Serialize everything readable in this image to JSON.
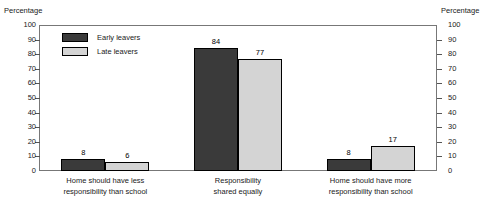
{
  "chart_data": {
    "type": "bar",
    "title": "",
    "subtitle": "",
    "xlabel": "",
    "ylabel": "Percentage",
    "ylabel_right": "Percentage",
    "ylim": [
      0,
      100
    ],
    "ytick_step": 10,
    "yticks": [
      100,
      90,
      80,
      70,
      60,
      50,
      40,
      30,
      20,
      10,
      0
    ],
    "grid": false,
    "legend_position": "top-left inside plot",
    "categories": [
      "Home should have less responsibility than school",
      "Responsibility shared equally",
      "Home should have more responsibility than school"
    ],
    "category_label_lines": [
      [
        "Home should have less",
        "responsibility than school"
      ],
      [
        "Responsibility",
        "shared equally"
      ],
      [
        "Home should have more",
        "responsibility than school"
      ]
    ],
    "series": [
      {
        "name": "Early leavers",
        "color": "#3a3a3a",
        "values": [
          8,
          84,
          8
        ],
        "value_labels": [
          "8",
          "84",
          "8"
        ]
      },
      {
        "name": "Late leavers",
        "color": "#d4d4d4",
        "values": [
          6,
          77,
          17
        ],
        "value_labels": [
          "6",
          "77",
          "17"
        ]
      }
    ]
  },
  "legend": {
    "items": [
      {
        "label": "Early leavers",
        "swatch": "early"
      },
      {
        "label": "Late leavers",
        "swatch": "late"
      }
    ]
  },
  "axes": {
    "left_title": "Percentage",
    "right_title": "Percentage"
  }
}
